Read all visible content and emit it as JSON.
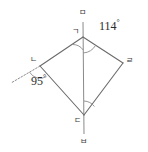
{
  "figure": {
    "type": "geometry-diagram",
    "background_color": "#ffffff",
    "stroke_color": "#6b6b6b",
    "label_color": "#3a3a3a",
    "width": 148,
    "height": 152
  },
  "vertices": {
    "g": {
      "label": "ㄱ",
      "x": 83,
      "y": 37
    },
    "n": {
      "label": "ㄴ",
      "x": 40,
      "y": 66
    },
    "d": {
      "label": "ㄷ",
      "x": 84,
      "y": 115
    },
    "r": {
      "label": "ㄹ",
      "x": 123,
      "y": 63
    },
    "m": {
      "label": "ㅁ",
      "x": 83,
      "y": 19
    },
    "b": {
      "label": "ㅂ",
      "x": 84,
      "y": 137
    }
  },
  "vertex_label_positions": {
    "g": {
      "x": 72,
      "y": 28
    },
    "n": {
      "x": 30,
      "y": 56
    },
    "d": {
      "x": 74,
      "y": 117
    },
    "r": {
      "x": 126,
      "y": 57
    },
    "m": {
      "x": 79,
      "y": 9
    },
    "b": {
      "x": 80,
      "y": 138
    }
  },
  "angles": [
    {
      "name": "angle-at-r-side",
      "value": "114",
      "unit": "°",
      "x": 99,
      "y": 19
    },
    {
      "name": "angle-at-n-exterior",
      "value": "95",
      "unit": "°",
      "x": 31,
      "y": 74
    }
  ],
  "segments": [
    {
      "name": "segment-g-n",
      "from": "g",
      "to": "n"
    },
    {
      "name": "segment-n-d",
      "from": "n",
      "to": "d"
    },
    {
      "name": "segment-d-r",
      "from": "d",
      "to": "r"
    },
    {
      "name": "segment-r-g",
      "from": "r",
      "to": "g"
    },
    {
      "name": "segment-m-b-axis",
      "from": "m",
      "to": "b"
    }
  ],
  "dashed_ray": {
    "name": "exterior-ray-at-n",
    "from_x": 40,
    "from_y": 66,
    "to_x": 11,
    "to_y": 83
  },
  "arcs": [
    {
      "name": "arc-at-g-left",
      "vertex": "g"
    },
    {
      "name": "arc-at-g-right",
      "vertex": "g"
    },
    {
      "name": "arc-at-d",
      "vertex": "d"
    },
    {
      "name": "arc-at-n",
      "vertex": "n"
    }
  ]
}
